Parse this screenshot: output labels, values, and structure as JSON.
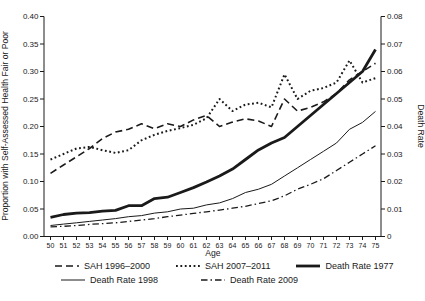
{
  "figure": {
    "background": "#ffffff",
    "line_color": "#1a1a1a"
  },
  "chart_data": {
    "type": "line",
    "title": "",
    "xlabel": "Age",
    "ylabel_left": "Proportion with Self-Assessed Health Fair or Poor",
    "ylabel_right": "Death Rate",
    "x": [
      50,
      51,
      52,
      53,
      54,
      55,
      56,
      57,
      58,
      59,
      60,
      61,
      62,
      63,
      64,
      65,
      66,
      67,
      68,
      69,
      70,
      71,
      72,
      73,
      74,
      75
    ],
    "x_tick_labels": [
      "50",
      "51",
      "52",
      "53",
      "54",
      "55",
      "56",
      "57",
      "58",
      "59",
      "60",
      "61",
      "62",
      "63",
      "64",
      "65",
      "66",
      "67",
      "68",
      "69",
      "70",
      "71",
      "72",
      "73",
      "74",
      "75"
    ],
    "y_axis_left": {
      "range": [
        0,
        0.4
      ],
      "tick_values": [
        0,
        0.05,
        0.1,
        0.15,
        0.2,
        0.25,
        0.3,
        0.35,
        0.4
      ],
      "tick_labels": [
        "0.00",
        "0.05",
        "0.10",
        "0.15",
        "0.20",
        "0.25",
        "0.30",
        "0.35",
        "0.40"
      ]
    },
    "y_axis_right": {
      "range": [
        0,
        0.08
      ],
      "tick_values": [
        0,
        0.01,
        0.02,
        0.03,
        0.04,
        0.05,
        0.06,
        0.07,
        0.08
      ],
      "tick_labels": [
        "0",
        "0.01",
        "0.02",
        "0.03",
        "0.04",
        "0.05",
        "0.06",
        "0.07",
        "0.08"
      ]
    },
    "grid": false,
    "legend_position": "bottom",
    "series": [
      {
        "name": "SAH 1996–2000",
        "key": "sah-1996-2000",
        "axis": "left",
        "style": "dashed",
        "values": [
          0.115,
          0.13,
          0.145,
          0.16,
          0.178,
          0.19,
          0.195,
          0.205,
          0.196,
          0.205,
          0.2,
          0.212,
          0.22,
          0.2,
          0.208,
          0.214,
          0.21,
          0.2,
          0.25,
          0.228,
          0.235,
          0.245,
          0.26,
          0.285,
          0.3,
          0.315
        ]
      },
      {
        "name": "SAH 2007–2011",
        "key": "sah-2007-2011",
        "axis": "left",
        "style": "dotted",
        "values": [
          0.14,
          0.15,
          0.16,
          0.163,
          0.157,
          0.152,
          0.157,
          0.175,
          0.185,
          0.192,
          0.197,
          0.203,
          0.215,
          0.25,
          0.228,
          0.24,
          0.243,
          0.235,
          0.295,
          0.25,
          0.265,
          0.27,
          0.28,
          0.32,
          0.28,
          0.288
        ]
      },
      {
        "name": "Death Rate 1977",
        "key": "death-rate-1977",
        "axis": "right",
        "style": "thick",
        "values": [
          0.007,
          0.008,
          0.0085,
          0.0087,
          0.0092,
          0.0095,
          0.0112,
          0.0112,
          0.0138,
          0.0143,
          0.016,
          0.0178,
          0.0198,
          0.022,
          0.0245,
          0.028,
          0.0315,
          0.034,
          0.036,
          0.04,
          0.044,
          0.048,
          0.052,
          0.056,
          0.06,
          0.068
        ]
      },
      {
        "name": "Death Rate 1998",
        "key": "death-rate-1998",
        "axis": "right",
        "style": "thin",
        "values": [
          0.004,
          0.0045,
          0.005,
          0.0055,
          0.006,
          0.0065,
          0.0072,
          0.0076,
          0.0085,
          0.009,
          0.01,
          0.0103,
          0.0115,
          0.0122,
          0.0138,
          0.016,
          0.0172,
          0.019,
          0.022,
          0.025,
          0.028,
          0.031,
          0.034,
          0.039,
          0.0415,
          0.0455
        ]
      },
      {
        "name": "Death Rate 2009",
        "key": "death-rate-2009",
        "axis": "right",
        "style": "dashdot",
        "values": [
          0.0035,
          0.0037,
          0.004,
          0.0044,
          0.0047,
          0.005,
          0.0055,
          0.006,
          0.0065,
          0.0072,
          0.0078,
          0.0084,
          0.009,
          0.0096,
          0.0103,
          0.011,
          0.012,
          0.013,
          0.0148,
          0.0172,
          0.019,
          0.021,
          0.024,
          0.027,
          0.03,
          0.033
        ]
      }
    ],
    "legend_rows": [
      [
        0,
        1,
        2
      ],
      [
        3,
        4
      ]
    ]
  }
}
